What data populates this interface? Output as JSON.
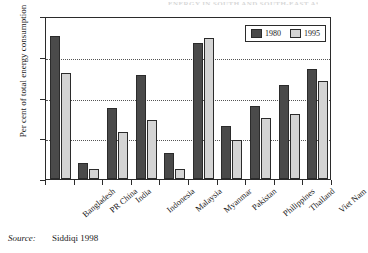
{
  "title_artifact": "ENERGY IN SOUTH AND SOUTH-EAST ASIAN COUNTRIES",
  "source": {
    "label": "Source:",
    "value": "Siddiqi 1998"
  },
  "legend": {
    "entries": [
      {
        "label": "1980",
        "color": "#4a4a4a"
      },
      {
        "label": "1995",
        "color": "#d4d4d4"
      }
    ]
  },
  "axes": {
    "y_title": "Per cent of total energy consumption",
    "y_ticks": [
      "0",
      "20",
      "40",
      "60",
      "80"
    ]
  },
  "chart_data": {
    "type": "bar",
    "title": "",
    "xlabel": "",
    "ylabel": "Per cent of total energy consumption",
    "ylim": [
      0,
      80
    ],
    "yticks": [
      0,
      20,
      40,
      60,
      80
    ],
    "grid": true,
    "legend_position": "top-right",
    "categories": [
      "Bangladesh",
      "PR China",
      "India",
      "Indonesia",
      "Malaysia",
      "Myanmar",
      "Pakistan",
      "Philippines",
      "Thailand",
      "Viet Nam"
    ],
    "series": [
      {
        "name": "1980",
        "color": "#4a4a4a",
        "values": [
          70,
          8,
          35,
          51,
          13,
          67,
          26,
          36,
          46,
          54
        ]
      },
      {
        "name": "1995",
        "color": "#d4d4d4",
        "values": [
          52,
          5,
          23,
          29,
          5,
          69,
          19,
          30,
          32,
          48
        ]
      }
    ]
  }
}
